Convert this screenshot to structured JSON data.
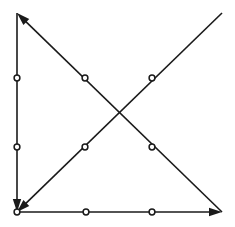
{
  "figure": {
    "background_color": "#ffffff",
    "stroke_color": "#1a1a1a",
    "marker_fill_color": "#ffffff",
    "width": 235,
    "height": 227,
    "line_width": 1.6,
    "marker_radius": 2.9,
    "marker_stroke_width": 1.5,
    "arrow_length": 13,
    "arrow_half_width": 4.2
  },
  "chart_data": {
    "type": "diagram",
    "xlabel": "",
    "ylabel": "",
    "grid": false,
    "legend": null,
    "xlim": [
      0,
      235
    ],
    "ylim": [
      0,
      227
    ],
    "nodes": [
      {
        "id": "top_left",
        "label": "",
        "x": 17,
        "y": 13,
        "marker": false
      },
      {
        "id": "top_right",
        "label": "",
        "x": 222,
        "y": 13,
        "marker": false
      },
      {
        "id": "bottom_left",
        "label": "",
        "x": 17,
        "y": 212,
        "marker": true
      },
      {
        "id": "bottom_right",
        "label": "",
        "x": 222,
        "y": 212,
        "marker": false
      }
    ],
    "edges": [
      {
        "id": "left_vertical",
        "label": "",
        "from": "top_left",
        "to": "bottom_left",
        "x1": 17,
        "y1": 13,
        "x2": 17,
        "y2": 212,
        "arrow_at": "end",
        "arrow_direction": "down"
      },
      {
        "id": "bottom_horizontal",
        "label": "",
        "from": "bottom_left",
        "to": "bottom_right",
        "x1": 17,
        "y1": 212,
        "x2": 222,
        "y2": 212,
        "arrow_at": "end",
        "arrow_direction": "right"
      },
      {
        "id": "descending_diagonal",
        "label": "",
        "from": "bottom_right",
        "to": "top_left",
        "x1": 222,
        "y1": 212,
        "x2": 17,
        "y2": 13,
        "arrow_at": "end",
        "arrow_direction": "up-left"
      },
      {
        "id": "ascending_diagonal",
        "label": "",
        "from": "top_right",
        "to": "bottom_left",
        "x1": 222,
        "y1": 13,
        "x2": 17,
        "y2": 212,
        "arrow_at": "end",
        "arrow_direction": "down-left"
      }
    ],
    "markers": [
      {
        "id": "marker-left-upper",
        "label": "",
        "x": 17,
        "y": 78,
        "on_edge": "left_vertical"
      },
      {
        "id": "marker-left-lower",
        "label": "",
        "x": 17,
        "y": 147,
        "on_edge": "left_vertical"
      },
      {
        "id": "marker-origin",
        "label": "",
        "x": 17,
        "y": 212,
        "on_edge": "bottom_left_vertex"
      },
      {
        "id": "marker-bottom-left-mid",
        "label": "",
        "x": 86,
        "y": 212,
        "on_edge": "bottom_horizontal"
      },
      {
        "id": "marker-bottom-right-mid",
        "label": "",
        "x": 152,
        "y": 212,
        "on_edge": "bottom_horizontal"
      },
      {
        "id": "marker-desc-upper",
        "label": "",
        "x": 85,
        "y": 78,
        "on_edge": "descending_diagonal"
      },
      {
        "id": "marker-desc-lower",
        "label": "",
        "x": 152,
        "y": 147,
        "on_edge": "descending_diagonal"
      },
      {
        "id": "marker-asc-upper",
        "label": "",
        "x": 152,
        "y": 78,
        "on_edge": "ascending_diagonal"
      },
      {
        "id": "marker-asc-lower",
        "label": "",
        "x": 85,
        "y": 147,
        "on_edge": "ascending_diagonal"
      }
    ],
    "intersections": [
      {
        "id": "diagonal-crossing",
        "label": "",
        "x": 119,
        "y": 112,
        "marker": false
      }
    ],
    "annotations": []
  }
}
